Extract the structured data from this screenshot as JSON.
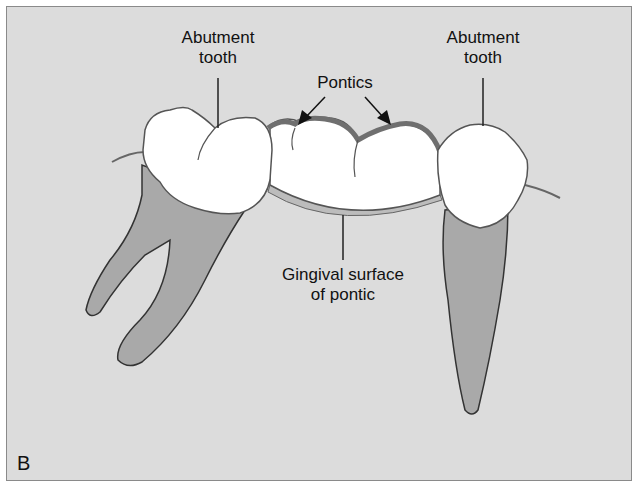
{
  "figure": {
    "panel_letter": "B",
    "labels": {
      "abutment_left_line1": "Abutment",
      "abutment_left_line2": "tooth",
      "abutment_right_line1": "Abutment",
      "abutment_right_line2": "tooth",
      "pontics": "Pontics",
      "gingival_line1": "Gingival surface",
      "gingival_line2": "of pontic"
    },
    "colors": {
      "background": "#dcdcdc",
      "crown": "#ffffff",
      "root": "#a9a9a9",
      "pontic_edge": "#6f6f6f",
      "outline": "#333333"
    }
  }
}
